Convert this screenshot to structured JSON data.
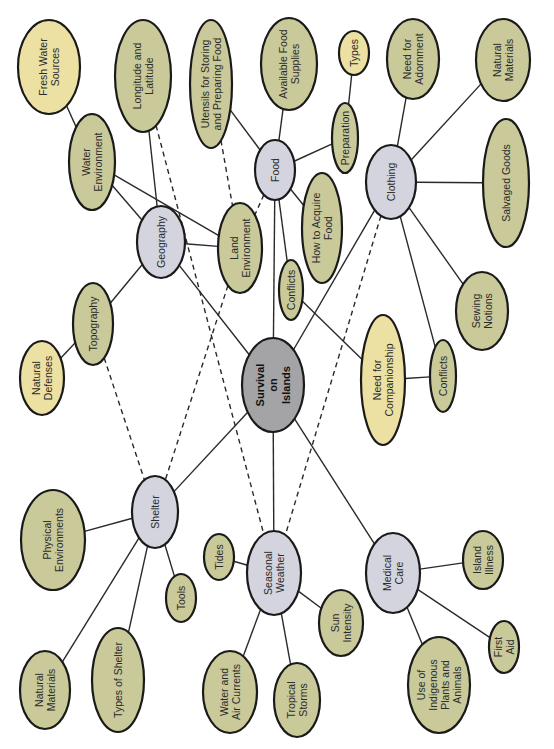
{
  "colors": {
    "detail": "#c9c99a",
    "category": "#d3d4de",
    "central": "#a4a4a6",
    "highlight": "#ece1a2",
    "stroke": "#1a1a1a"
  },
  "nodes": [
    {
      "id": "survival",
      "label": [
        "Survival",
        "on",
        "Islands"
      ],
      "type": "central",
      "cx": 273,
      "cy": 385,
      "rx": 31,
      "ry": 47
    },
    {
      "id": "geography",
      "label": [
        "Geography"
      ],
      "type": "category",
      "cx": 161,
      "cy": 242,
      "rx": 24,
      "ry": 36
    },
    {
      "id": "food",
      "label": [
        "Food"
      ],
      "type": "category",
      "cx": 275,
      "cy": 170,
      "rx": 20,
      "ry": 30
    },
    {
      "id": "clothing",
      "label": [
        "Clothing"
      ],
      "type": "category",
      "cx": 391,
      "cy": 182,
      "rx": 25,
      "ry": 37
    },
    {
      "id": "shelter",
      "label": [
        "Shelter"
      ],
      "type": "category",
      "cx": 155,
      "cy": 512,
      "rx": 23,
      "ry": 36
    },
    {
      "id": "seasonal-weather",
      "label": [
        "Seasonal",
        "Weather"
      ],
      "type": "category",
      "cx": 274,
      "cy": 573,
      "rx": 27,
      "ry": 42
    },
    {
      "id": "medical-care",
      "label": [
        "Medical",
        "Care"
      ],
      "type": "category",
      "cx": 393,
      "cy": 573,
      "rx": 27,
      "ry": 40
    },
    {
      "id": "fresh-water-sources",
      "label": [
        "Fresh Water",
        "Sources"
      ],
      "type": "highlight",
      "cx": 49,
      "cy": 67,
      "rx": 31,
      "ry": 47
    },
    {
      "id": "longitude-latitude",
      "label": [
        "Longitude and",
        "Latitude"
      ],
      "type": "detail",
      "cx": 143,
      "cy": 76,
      "rx": 28,
      "ry": 56
    },
    {
      "id": "utensils",
      "label": [
        "Utensils for Storing",
        "and Preparing Food"
      ],
      "type": "detail",
      "cx": 211,
      "cy": 84,
      "rx": 21,
      "ry": 64
    },
    {
      "id": "available-food-supplies",
      "label": [
        "Available Food",
        "Supplies"
      ],
      "type": "detail",
      "cx": 289,
      "cy": 64,
      "rx": 28,
      "ry": 46
    },
    {
      "id": "types",
      "label": [
        "Types"
      ],
      "type": "highlight",
      "cx": 354,
      "cy": 53,
      "rx": 15,
      "ry": 22
    },
    {
      "id": "need-for-adornment",
      "label": [
        "Need for",
        "Adornment"
      ],
      "type": "detail",
      "cx": 413,
      "cy": 59,
      "rx": 26,
      "ry": 40
    },
    {
      "id": "natural-materials-clothing",
      "label": [
        "Natural",
        "Materials"
      ],
      "type": "detail",
      "cx": 503,
      "cy": 60,
      "rx": 27,
      "ry": 41
    },
    {
      "id": "water-environment",
      "label": [
        "Water",
        "Environment"
      ],
      "type": "detail",
      "cx": 92,
      "cy": 162,
      "rx": 23,
      "ry": 48
    },
    {
      "id": "preparation",
      "label": [
        "Preparation"
      ],
      "type": "detail",
      "cx": 345,
      "cy": 138,
      "rx": 13,
      "ry": 35
    },
    {
      "id": "salvaged-goods",
      "label": [
        "Salvaged Goods"
      ],
      "type": "detail",
      "cx": 506,
      "cy": 183,
      "rx": 23,
      "ry": 64
    },
    {
      "id": "land-environment",
      "label": [
        "Land",
        "Environment"
      ],
      "type": "detail",
      "cx": 240,
      "cy": 248,
      "rx": 22,
      "ry": 45
    },
    {
      "id": "how-to-acquire-food",
      "label": [
        "How to Acquire",
        "Food"
      ],
      "type": "detail",
      "cx": 322,
      "cy": 228,
      "rx": 20,
      "ry": 55
    },
    {
      "id": "conflicts-food",
      "label": [
        "Conflicts"
      ],
      "type": "detail",
      "cx": 291,
      "cy": 290,
      "rx": 12,
      "ry": 30
    },
    {
      "id": "topography",
      "label": [
        "Topography"
      ],
      "type": "detail",
      "cx": 93,
      "cy": 324,
      "rx": 20,
      "ry": 41
    },
    {
      "id": "natural-defenses",
      "label": [
        "Natural",
        "Defenses"
      ],
      "type": "highlight",
      "cx": 42,
      "cy": 378,
      "rx": 22,
      "ry": 37
    },
    {
      "id": "need-for-companionship",
      "label": [
        "Need for",
        "Companionship"
      ],
      "type": "highlight",
      "cx": 383,
      "cy": 380,
      "rx": 22,
      "ry": 65
    },
    {
      "id": "conflicts-clothing",
      "label": [
        "Conflicts"
      ],
      "type": "detail",
      "cx": 443,
      "cy": 376,
      "rx": 13,
      "ry": 36
    },
    {
      "id": "sewing-notions",
      "label": [
        "Sewing",
        "Notions"
      ],
      "type": "detail",
      "cx": 482,
      "cy": 311,
      "rx": 26,
      "ry": 39
    },
    {
      "id": "physical-environments",
      "label": [
        "Physical",
        "Environments"
      ],
      "type": "detail",
      "cx": 53,
      "cy": 540,
      "rx": 32,
      "ry": 50
    },
    {
      "id": "tools",
      "label": [
        "Tools"
      ],
      "type": "detail",
      "cx": 181,
      "cy": 598,
      "rx": 15,
      "ry": 24
    },
    {
      "id": "natural-materials-shelter",
      "label": [
        "Natural",
        "Materials"
      ],
      "type": "detail",
      "cx": 45,
      "cy": 690,
      "rx": 25,
      "ry": 39
    },
    {
      "id": "types-of-shelter",
      "label": [
        "Types of Shelter"
      ],
      "type": "detail",
      "cx": 118,
      "cy": 680,
      "rx": 26,
      "ry": 52
    },
    {
      "id": "tides",
      "label": [
        "Tides"
      ],
      "type": "detail",
      "cx": 219,
      "cy": 557,
      "rx": 15,
      "ry": 23
    },
    {
      "id": "sun-intensity",
      "label": [
        "Sun",
        "Intensity"
      ],
      "type": "detail",
      "cx": 341,
      "cy": 623,
      "rx": 22,
      "ry": 33
    },
    {
      "id": "water-air-currents",
      "label": [
        "Water and",
        "Air Currents"
      ],
      "type": "detail",
      "cx": 230,
      "cy": 692,
      "rx": 27,
      "ry": 41
    },
    {
      "id": "tropical-storms",
      "label": [
        "Tropical",
        "Storms"
      ],
      "type": "detail",
      "cx": 297,
      "cy": 700,
      "rx": 23,
      "ry": 37
    },
    {
      "id": "island-illness",
      "label": [
        "Island",
        "Illness"
      ],
      "type": "detail",
      "cx": 483,
      "cy": 560,
      "rx": 20,
      "ry": 29
    },
    {
      "id": "indigenous-plants",
      "label": [
        "Use of",
        "Indigenous",
        "Plants and",
        "Animals"
      ],
      "type": "detail",
      "cx": 439,
      "cy": 685,
      "rx": 31,
      "ry": 48
    },
    {
      "id": "first-aid",
      "label": [
        "First",
        "Aid"
      ],
      "type": "detail",
      "cx": 504,
      "cy": 647,
      "rx": 15,
      "ry": 26
    }
  ],
  "edges": [
    {
      "from": "survival",
      "to": "geography",
      "style": "solid"
    },
    {
      "from": "survival",
      "to": "food",
      "style": "solid"
    },
    {
      "from": "survival",
      "to": "clothing",
      "style": "solid"
    },
    {
      "from": "survival",
      "to": "shelter",
      "style": "solid"
    },
    {
      "from": "survival",
      "to": "seasonal-weather",
      "style": "solid"
    },
    {
      "from": "survival",
      "to": "medical-care",
      "style": "solid"
    },
    {
      "from": "geography",
      "to": "water-environment",
      "style": "solid"
    },
    {
      "from": "geography",
      "to": "longitude-latitude",
      "style": "solid"
    },
    {
      "from": "geography",
      "to": "land-environment",
      "style": "solid"
    },
    {
      "from": "geography",
      "to": "topography",
      "style": "solid"
    },
    {
      "from": "water-environment",
      "to": "fresh-water-sources",
      "style": "solid"
    },
    {
      "from": "water-environment",
      "to": "land-environment",
      "style": "solid"
    },
    {
      "from": "topography",
      "to": "natural-defenses",
      "style": "solid"
    },
    {
      "from": "food",
      "to": "utensils",
      "style": "solid"
    },
    {
      "from": "food",
      "to": "available-food-supplies",
      "style": "solid"
    },
    {
      "from": "food",
      "to": "preparation",
      "style": "solid"
    },
    {
      "from": "food",
      "to": "how-to-acquire-food",
      "style": "solid"
    },
    {
      "from": "food",
      "to": "conflicts-food",
      "style": "solid"
    },
    {
      "from": "preparation",
      "to": "types",
      "style": "solid"
    },
    {
      "from": "conflicts-food",
      "to": "need-for-companionship",
      "style": "solid"
    },
    {
      "from": "clothing",
      "to": "need-for-adornment",
      "style": "solid"
    },
    {
      "from": "clothing",
      "to": "natural-materials-clothing",
      "style": "solid"
    },
    {
      "from": "clothing",
      "to": "salvaged-goods",
      "style": "solid"
    },
    {
      "from": "clothing",
      "to": "sewing-notions",
      "style": "solid"
    },
    {
      "from": "clothing",
      "to": "conflicts-clothing",
      "style": "solid"
    },
    {
      "from": "need-for-companionship",
      "to": "conflicts-clothing",
      "style": "solid"
    },
    {
      "from": "shelter",
      "to": "physical-environments",
      "style": "solid"
    },
    {
      "from": "shelter",
      "to": "natural-materials-shelter",
      "style": "solid"
    },
    {
      "from": "shelter",
      "to": "types-of-shelter",
      "style": "solid"
    },
    {
      "from": "shelter",
      "to": "tools",
      "style": "solid"
    },
    {
      "from": "seasonal-weather",
      "to": "tides",
      "style": "solid"
    },
    {
      "from": "seasonal-weather",
      "to": "water-air-currents",
      "style": "solid"
    },
    {
      "from": "seasonal-weather",
      "to": "tropical-storms",
      "style": "solid"
    },
    {
      "from": "seasonal-weather",
      "to": "sun-intensity",
      "style": "solid"
    },
    {
      "from": "medical-care",
      "to": "island-illness",
      "style": "solid"
    },
    {
      "from": "medical-care",
      "to": "indigenous-plants",
      "style": "solid"
    },
    {
      "from": "medical-care",
      "to": "first-aid",
      "style": "solid"
    },
    {
      "from": "longitude-latitude",
      "to": "seasonal-weather",
      "style": "dashed"
    },
    {
      "from": "utensils",
      "to": "land-environment",
      "style": "dashed"
    },
    {
      "from": "food",
      "to": "land-environment",
      "style": "dashed"
    },
    {
      "from": "topography",
      "to": "shelter",
      "style": "dashed"
    },
    {
      "from": "land-environment",
      "to": "shelter",
      "style": "dashed"
    },
    {
      "from": "clothing",
      "to": "seasonal-weather",
      "style": "dashed"
    }
  ]
}
